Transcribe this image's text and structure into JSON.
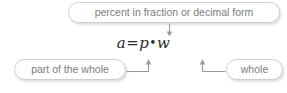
{
  "diagram": {
    "type": "labeled-equation-callout",
    "background_color": "#ffffff",
    "box_border_color": "#cfcfcf",
    "box_text_color": "#7d7d7d",
    "equation_text_color": "#2b2b2b",
    "connector_color": "#9a9a9a",
    "equation": {
      "full": "a = p • w",
      "left_term": "a",
      "operator_equals": "=",
      "middle_term": "p",
      "operator_multiply": "•",
      "right_term": "w"
    },
    "callouts": {
      "percent": "percent in fraction or decimal form",
      "part": "part of the whole",
      "whole": "whole"
    },
    "connectors": [
      {
        "name": "percent-to-p",
        "from": "percent-callout",
        "to": "equation-term-p",
        "direction": "down"
      },
      {
        "name": "part-to-a",
        "from": "part-callout",
        "to": "equation-term-a",
        "direction": "up"
      },
      {
        "name": "whole-to-w",
        "from": "whole-callout",
        "to": "equation-term-w",
        "direction": "up"
      }
    ]
  }
}
